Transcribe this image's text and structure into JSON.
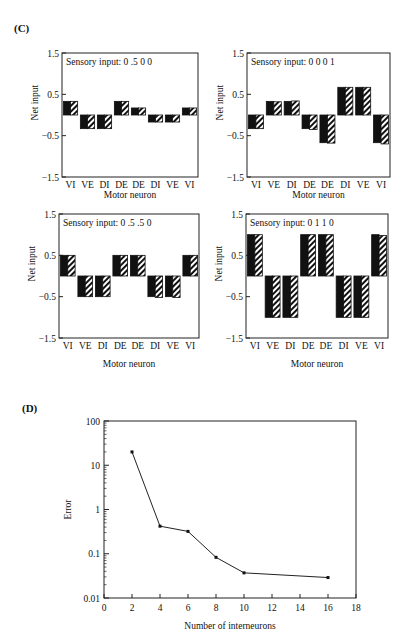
{
  "panel_labels": {
    "c": "(C)",
    "d": "(D)"
  },
  "chart_data": [
    {
      "id": "c1",
      "type": "bar",
      "title": "Sensory input:  0  .5  0  0",
      "xlabel": "Motor neuron",
      "ylabel": "Net input",
      "categories": [
        "VI",
        "VE",
        "DI",
        "DE",
        "DE",
        "DI",
        "VE",
        "VI"
      ],
      "yticks": [
        1.5,
        0.5,
        -0.5,
        -1.5
      ],
      "ytick_labels": [
        "1.5",
        "0.5",
        "−0.5",
        "−1.5"
      ],
      "ylim": [
        -1.5,
        1.5
      ],
      "series": [
        {
          "name": "target",
          "fill": "solid",
          "values": [
            0.33,
            -0.33,
            -0.33,
            0.33,
            0.17,
            -0.17,
            -0.17,
            0.17
          ]
        },
        {
          "name": "network",
          "fill": "hatched",
          "values": [
            0.33,
            -0.33,
            -0.33,
            0.33,
            0.17,
            -0.17,
            -0.17,
            0.17
          ]
        }
      ]
    },
    {
      "id": "c2",
      "type": "bar",
      "title": "Sensory input:  0  0  0  1",
      "xlabel": "Motor neuron",
      "ylabel": "Net input",
      "categories": [
        "VI",
        "VE",
        "DI",
        "DE",
        "DE",
        "DI",
        "VE",
        "VI"
      ],
      "yticks": [
        1.5,
        0.5,
        -0.5,
        -1.5
      ],
      "ytick_labels": [
        "1.5",
        "0.5",
        "−0.5",
        "−1.5"
      ],
      "ylim": [
        -1.5,
        1.5
      ],
      "series": [
        {
          "name": "target",
          "fill": "solid",
          "values": [
            -0.33,
            0.33,
            0.33,
            -0.33,
            -0.67,
            0.67,
            0.67,
            -0.67
          ]
        },
        {
          "name": "network",
          "fill": "hatched",
          "values": [
            -0.33,
            0.32,
            0.34,
            -0.35,
            -0.68,
            0.67,
            0.67,
            -0.7
          ]
        }
      ]
    },
    {
      "id": "c3",
      "type": "bar",
      "title": "Sensory input:  0  .5  .5  0",
      "xlabel": "Motor neuron",
      "ylabel": "Net input",
      "categories": [
        "VI",
        "VE",
        "DI",
        "DE",
        "DE",
        "DI",
        "VE",
        "VI"
      ],
      "yticks": [
        1.5,
        0.5,
        -0.5,
        -1.5
      ],
      "ytick_labels": [
        "1.5",
        "0.5",
        "−0.5",
        "−1.5"
      ],
      "ylim": [
        -1.5,
        1.5
      ],
      "series": [
        {
          "name": "target",
          "fill": "solid",
          "values": [
            0.5,
            -0.5,
            -0.5,
            0.5,
            0.5,
            -0.5,
            -0.5,
            0.5
          ]
        },
        {
          "name": "network",
          "fill": "hatched",
          "values": [
            0.5,
            -0.5,
            -0.5,
            0.5,
            0.5,
            -0.52,
            -0.52,
            0.5
          ]
        }
      ]
    },
    {
      "id": "c4",
      "type": "bar",
      "title": "Sensory input:  0  1  1  0",
      "xlabel": "Motor neuron",
      "ylabel": "Net input",
      "categories": [
        "VI",
        "VE",
        "DI",
        "DE",
        "DE",
        "DI",
        "VE",
        "VI"
      ],
      "yticks": [
        1.5,
        0.5,
        -0.5,
        -1.5
      ],
      "ytick_labels": [
        "1.5",
        "0.5",
        "−0.5",
        "−1.5"
      ],
      "ylim": [
        -1.5,
        1.5
      ],
      "series": [
        {
          "name": "target",
          "fill": "solid",
          "values": [
            1.0,
            -1.0,
            -1.0,
            1.0,
            1.0,
            -1.0,
            -1.0,
            1.0
          ]
        },
        {
          "name": "network",
          "fill": "hatched",
          "values": [
            1.0,
            -1.0,
            -1.0,
            1.0,
            1.0,
            -1.0,
            -1.0,
            0.98
          ]
        }
      ]
    },
    {
      "id": "d",
      "type": "line",
      "title": "",
      "xlabel": "Number of interneurons",
      "ylabel": "Error",
      "yscale": "log",
      "x": [
        2,
        4,
        6,
        8,
        10,
        16
      ],
      "y": [
        20,
        0.42,
        0.32,
        0.083,
        0.037,
        0.029
      ],
      "xlim": [
        0,
        18
      ],
      "ylim": [
        0.01,
        100
      ],
      "xticks": [
        0,
        2,
        4,
        6,
        8,
        10,
        12,
        14,
        16,
        18
      ],
      "yticks": [
        100,
        10,
        1,
        0.1,
        0.01
      ],
      "ytick_labels": [
        "100",
        "10",
        "1",
        "0.1",
        "0.01"
      ],
      "grid": false
    }
  ]
}
